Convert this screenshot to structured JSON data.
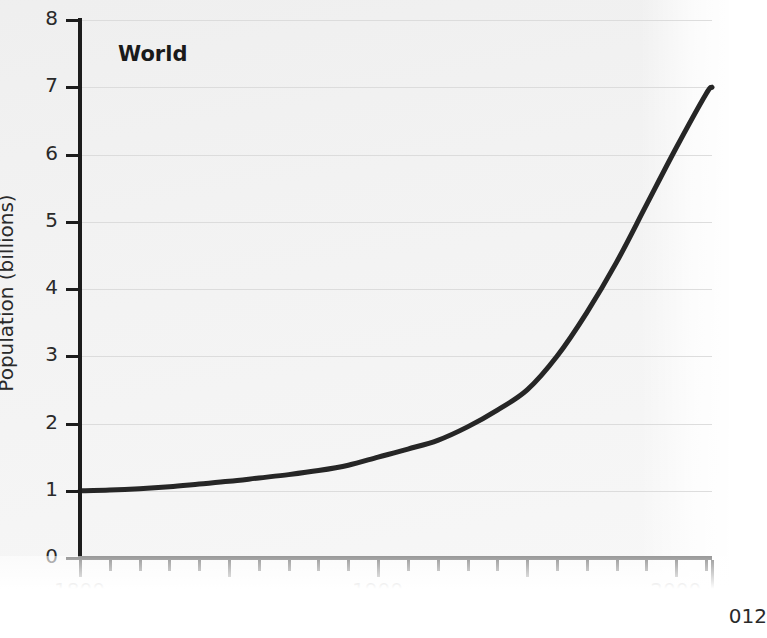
{
  "chart_data": {
    "type": "line",
    "title": "World",
    "xlabel": "",
    "ylabel": "Population (billions)",
    "xlim": [
      1800,
      2012
    ],
    "ylim": [
      0,
      8
    ],
    "grid": true,
    "legend": null,
    "x_tick_labels": [
      {
        "value": 1800,
        "label": "1800"
      },
      {
        "value": 1900,
        "label": "1900"
      },
      {
        "value": 2000,
        "label": "2000"
      },
      {
        "value": 2012,
        "label": "2012"
      }
    ],
    "y_tick_labels": [
      "0",
      "1",
      "2",
      "3",
      "4",
      "5",
      "6",
      "7",
      "8"
    ],
    "x_minor_tick_step": 10,
    "x_major_tick_step": 50,
    "series": [
      {
        "name": "World population",
        "color": "#262626",
        "x": [
          1800,
          1810,
          1820,
          1830,
          1840,
          1850,
          1860,
          1870,
          1880,
          1890,
          1900,
          1910,
          1920,
          1930,
          1940,
          1950,
          1960,
          1970,
          1980,
          1990,
          2000,
          2010,
          2012
        ],
        "values": [
          1.0,
          1.01,
          1.03,
          1.06,
          1.1,
          1.14,
          1.19,
          1.24,
          1.3,
          1.38,
          1.5,
          1.62,
          1.75,
          1.95,
          2.2,
          2.5,
          3.0,
          3.65,
          4.4,
          5.25,
          6.1,
          6.9,
          7.0
        ]
      }
    ],
    "annotations": [
      {
        "text": "World",
        "kind": "panel-label"
      }
    ]
  }
}
